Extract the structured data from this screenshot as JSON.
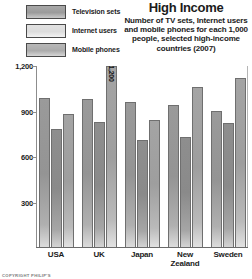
{
  "chart_data": {
    "type": "bar",
    "title": "High Income",
    "subtitle": "Number of TV sets, Internet users and mobile phones for each 1,000 people, selected high-income countries (2007)",
    "xlabel": "",
    "ylabel": "",
    "ylim": [
      0,
      1200
    ],
    "yticks": [
      "300",
      "600",
      "900",
      "1,200"
    ],
    "ytick_values": [
      300,
      600,
      900,
      1200
    ],
    "grid": false,
    "legend_position": "top-left",
    "categories": [
      "USA",
      "UK",
      "Japan",
      "New Zealand",
      "Sweden"
    ],
    "series": [
      {
        "name": "Television sets",
        "color": "#9a9a9a",
        "values": [
          990,
          980,
          960,
          940,
          900
        ]
      },
      {
        "name": "Internet users",
        "color": "#8e8e8e",
        "values": [
          780,
          830,
          710,
          730,
          820
        ]
      },
      {
        "name": "Mobile phones",
        "color": "#a4a4a4",
        "values": [
          880,
          1200,
          840,
          1060,
          1120
        ]
      }
    ],
    "annotations": [
      {
        "category": "UK",
        "series": "Mobile phones",
        "label": "1,200"
      }
    ]
  },
  "legend": {
    "items": [
      {
        "label": "Television sets",
        "swatch": "tv-swatch"
      },
      {
        "label": "Internet users",
        "swatch": "internet-swatch"
      },
      {
        "label": "Mobile phones",
        "swatch": "mobile-swatch"
      }
    ]
  },
  "footer": {
    "copyright": "COPYRIGHT PHILIP'S"
  }
}
